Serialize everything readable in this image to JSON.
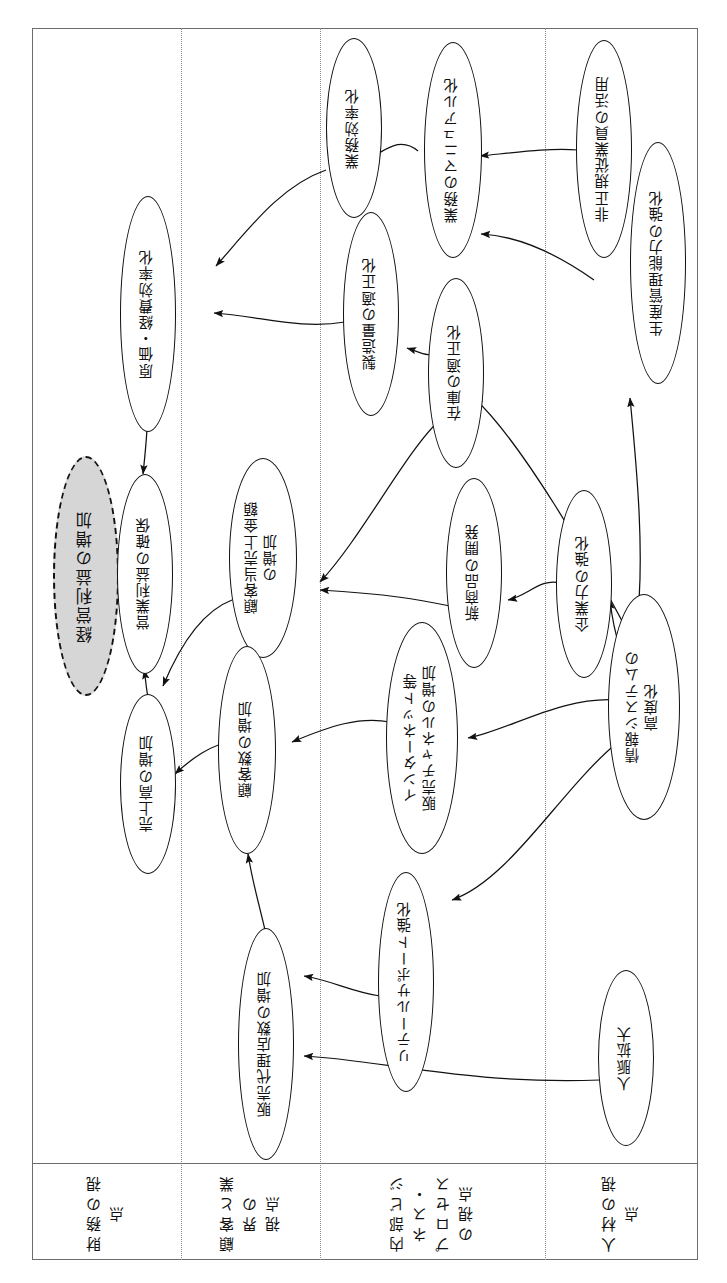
{
  "diagram": {
    "type": "strategy-map",
    "orientation": "rotated-90"
  },
  "perspectives": [
    {
      "id": "financial",
      "label": "財務の視点"
    },
    {
      "id": "customer",
      "label": "顧客と業界の\n視点"
    },
    {
      "id": "process",
      "label": "内部ビジネス・\nプロセスの視点"
    },
    {
      "id": "people",
      "label": "人材の視点"
    }
  ],
  "nodes": [
    {
      "id": "n_goal",
      "label": "経営利益の増加",
      "perspective": "financial",
      "style": "goal"
    },
    {
      "id": "n_eigyo",
      "label": "営業利益の確保",
      "perspective": "financial",
      "style": "normal"
    },
    {
      "id": "n_uriage",
      "label": "売上高の増加",
      "perspective": "financial",
      "style": "normal"
    },
    {
      "id": "n_genka",
      "label": "原価・経費効率化",
      "perspective": "financial",
      "style": "normal"
    },
    {
      "id": "n_kokyakuuri",
      "label": "顧客当売上金額\nの増加",
      "perspective": "customer",
      "style": "normal"
    },
    {
      "id": "n_kokyakusu",
      "label": "顧客数の増加",
      "perspective": "customer",
      "style": "normal"
    },
    {
      "id": "n_hanbai",
      "label": "販売代理店数の増加",
      "perspective": "customer",
      "style": "normal"
    },
    {
      "id": "n_gyoumu",
      "label": "業務効率化",
      "perspective": "process",
      "style": "normal"
    },
    {
      "id": "n_seizou",
      "label": "製造量の適正化",
      "perspective": "process",
      "style": "normal"
    },
    {
      "id": "n_zaiko",
      "label": "在庫の適正化",
      "perspective": "process",
      "style": "normal"
    },
    {
      "id": "n_shinshohin",
      "label": "新商品の開発",
      "perspective": "process",
      "style": "normal"
    },
    {
      "id": "n_internet",
      "label": "インターネット等\n販売チャネルの増加",
      "perspective": "process",
      "style": "normal"
    },
    {
      "id": "n_retail",
      "label": "リテールサポート強化",
      "perspective": "process",
      "style": "normal"
    },
    {
      "id": "n_manual",
      "label": "業務のマニュアル化",
      "perspective": "process",
      "style": "normal"
    },
    {
      "id": "n_kigyou",
      "label": "企業力の強化",
      "perspective": "process",
      "style": "normal"
    },
    {
      "id": "n_hiseiki",
      "label": "非正規従業員の活用",
      "perspective": "people",
      "style": "normal"
    },
    {
      "id": "n_seisankanri",
      "label": "生産管理能力の強化",
      "perspective": "people",
      "style": "normal"
    },
    {
      "id": "n_joho",
      "label": "情報システムの\n高度化",
      "perspective": "people",
      "style": "normal"
    },
    {
      "id": "n_jinmyaku",
      "label": "人脈拡大",
      "perspective": "people",
      "style": "normal"
    }
  ],
  "edges": [
    {
      "from": "n_eigyo",
      "to": "n_goal"
    },
    {
      "from": "n_uriage",
      "to": "n_eigyo"
    },
    {
      "from": "n_genka",
      "to": "n_eigyo"
    },
    {
      "from": "n_kokyakuuri",
      "to": "n_uriage"
    },
    {
      "from": "n_kokyakusu",
      "to": "n_uriage"
    },
    {
      "from": "n_gyoumu",
      "to": "n_genka"
    },
    {
      "from": "n_seizou",
      "to": "n_genka"
    },
    {
      "from": "n_manual",
      "to": "n_gyoumu"
    },
    {
      "from": "n_zaiko",
      "to": "n_seizou"
    },
    {
      "from": "n_zaiko",
      "to": "n_kokyakuuri"
    },
    {
      "from": "n_shinshohin",
      "to": "n_kokyakuuri"
    },
    {
      "from": "n_kigyou",
      "to": "n_shinshohin"
    },
    {
      "from": "n_internet",
      "to": "n_kokyakusu"
    },
    {
      "from": "n_hanbai",
      "to": "n_kokyakusu"
    },
    {
      "from": "n_retail",
      "to": "n_hanbai"
    },
    {
      "from": "n_jinmyaku",
      "to": "n_hanbai"
    },
    {
      "from": "n_joho",
      "to": "n_internet"
    },
    {
      "from": "n_joho",
      "to": "n_retail"
    },
    {
      "from": "n_joho",
      "to": "n_kigyou"
    },
    {
      "from": "n_joho",
      "to": "n_zaiko"
    },
    {
      "from": "n_joho",
      "to": "n_seisankanri"
    },
    {
      "from": "n_hiseiki",
      "to": "n_manual"
    },
    {
      "from": "n_seisankanri",
      "to": "n_manual"
    }
  ]
}
